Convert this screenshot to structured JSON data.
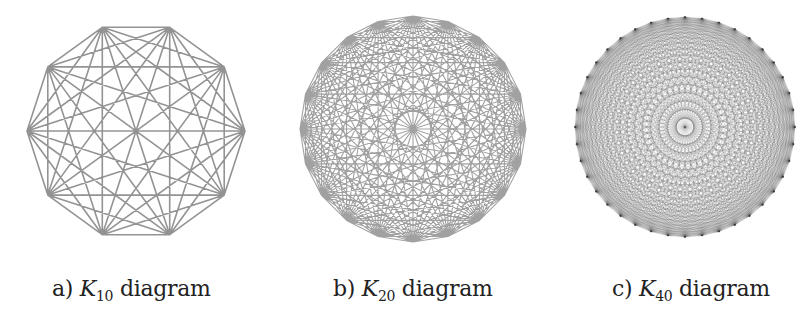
{
  "figure": {
    "panels": [
      {
        "id": "a",
        "label_prefix": "a)",
        "symbol": "K",
        "subscript": "10",
        "label_suffix": "diagram",
        "vertices": 10,
        "center": [
          136,
          131
        ],
        "radius": 109,
        "rotation_deg": 0,
        "stroke_color": "#3a3a3a",
        "stroke_width": 1.6,
        "stroke_opacity": 0.55,
        "caption_x": 52
      },
      {
        "id": "b",
        "label_prefix": "b)",
        "symbol": "K",
        "subscript": "20",
        "label_suffix": "diagram",
        "vertices": 20,
        "center": [
          413,
          129
        ],
        "radius": 113,
        "rotation_deg": 0,
        "stroke_color": "#2e2e2e",
        "stroke_width": 1.1,
        "stroke_opacity": 0.45,
        "caption_x": 333
      },
      {
        "id": "c",
        "label_prefix": "c)",
        "symbol": "K",
        "subscript": "40",
        "label_suffix": "diagram",
        "vertices": 40,
        "center": [
          685,
          127
        ],
        "radius": 110,
        "rotation_deg": 0,
        "stroke_color": "#333333",
        "stroke_width": 0.5,
        "stroke_opacity": 0.28,
        "caption_x": 612
      }
    ]
  }
}
